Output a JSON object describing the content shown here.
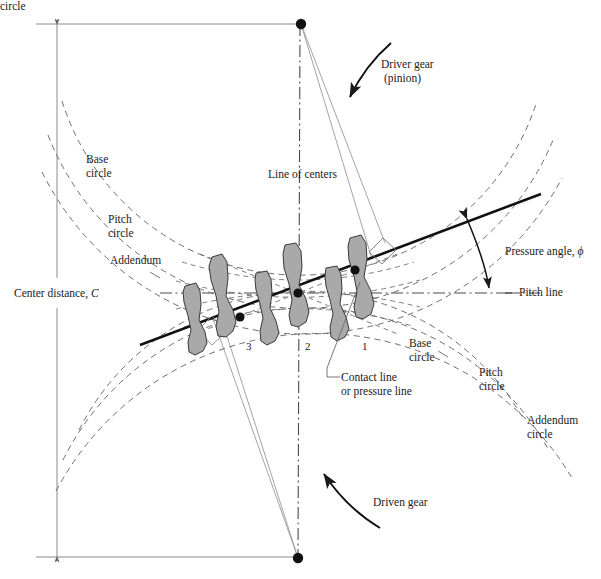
{
  "figure": {
    "type": "engineering-diagram"
  },
  "colors": {
    "ink": "#1a1a1a",
    "thin_line": "#8a8a8a",
    "dashed_line": "#6e6e6e",
    "tooth_fill": "#a9a9a9",
    "tooth_stroke": "#3a3a3a",
    "background": "#ffffff"
  },
  "labels": {
    "center_distance": "Center distance, ",
    "center_distance_symbol": "C",
    "line_of_centers": "Line of centers",
    "driver_gear_line1": "Driver gear",
    "driver_gear_line2": "(pinion)",
    "driven_gear": "Driven gear",
    "pressure_angle": "Pressure angle, ",
    "pressure_angle_symbol": "ϕ",
    "pitch_line": "Pitch line",
    "contact_line_1": "Contact line",
    "contact_line_2": "or pressure line",
    "left_base_1": "Base",
    "left_base_2": "circle",
    "left_pitch_1": "Pitch",
    "left_pitch_2": "circle",
    "left_addendum_1": "Addendum",
    "left_addendum_2": "circle",
    "right_base_1": "Base",
    "right_base_2": "circle",
    "right_pitch_1": "Pitch",
    "right_pitch_2": "circle",
    "right_addendum_1": "Addendum",
    "right_addendum_2": "circle"
  },
  "tooth_positions": {
    "pos_1": "1",
    "pos_2": "2",
    "pos_3": "3"
  },
  "geometry": {
    "pinion_center": {
      "x": 301,
      "y": 24
    },
    "gear_center": {
      "x": 298,
      "y": 558
    },
    "pitch_point": {
      "x": 298,
      "y": 293
    },
    "pitch_line_y": 293,
    "contact_line_start": {
      "x": 140,
      "y": 345
    },
    "contact_line_end": {
      "x": 541,
      "y": 194
    },
    "contact_points": [
      {
        "label": "3",
        "x": 240,
        "y": 317
      },
      {
        "label": "2",
        "x": 298,
        "y": 293
      },
      {
        "label": "1",
        "x": 355,
        "y": 270
      }
    ],
    "dimension_line_x": 57,
    "dimension_top_y": 25,
    "dimension_bottom_y": 557
  }
}
